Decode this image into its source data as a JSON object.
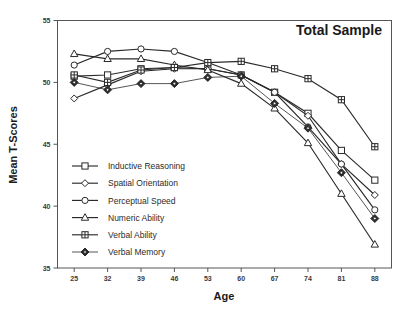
{
  "chart_data": {
    "type": "line",
    "title": "Total Sample",
    "xlabel": "Age",
    "ylabel": "Mean T-Scores",
    "x": [
      25,
      32,
      39,
      46,
      53,
      60,
      67,
      74,
      81,
      88
    ],
    "xtick_labels": [
      "25",
      "32",
      "39",
      "46",
      "53",
      "60",
      "67",
      "74",
      "81",
      "88"
    ],
    "ytick_labels": [
      "35",
      "40",
      "45",
      "50",
      "55"
    ],
    "yticks": [
      35,
      40,
      45,
      50,
      55
    ],
    "xlim": [
      21.5,
      91.5
    ],
    "ylim": [
      35,
      55
    ],
    "grid": false,
    "legend_position": "lower-left-inside",
    "series": [
      {
        "name": "Inductive Reasoning",
        "marker": "square-open",
        "values": [
          50.5,
          50.6,
          51.1,
          51.2,
          51.1,
          50.6,
          49.2,
          47.5,
          44.5,
          42.1
        ]
      },
      {
        "name": "Spatial Orientation",
        "marker": "diamond-open",
        "values": [
          48.7,
          49.8,
          50.9,
          51.1,
          51.1,
          50.6,
          49.2,
          47.3,
          43.4,
          40.9
        ]
      },
      {
        "name": "Perceptual Speed",
        "marker": "circle-open",
        "values": [
          51.4,
          52.5,
          52.7,
          52.5,
          51.6,
          50.6,
          49.2,
          46.4,
          43.4,
          39.7
        ]
      },
      {
        "name": "Numeric Ability",
        "marker": "triangle-open",
        "values": [
          52.3,
          51.9,
          51.9,
          51.4,
          51.0,
          49.9,
          47.9,
          45.1,
          41.0,
          36.9
        ]
      },
      {
        "name": "Verbal Ability",
        "marker": "square-crossed",
        "values": [
          50.6,
          50.0,
          51.0,
          51.2,
          51.6,
          51.7,
          51.1,
          50.3,
          48.6,
          44.8
        ]
      },
      {
        "name": "Verbal Memory",
        "marker": "diamond-filled",
        "values": [
          50.0,
          49.4,
          49.9,
          49.9,
          50.4,
          50.5,
          48.3,
          46.3,
          42.7,
          39.0
        ]
      }
    ]
  },
  "legend": {
    "items": [
      {
        "label": "Inductive Reasoning"
      },
      {
        "label": "Spatial Orientation"
      },
      {
        "label": "Perceptual Speed"
      },
      {
        "label": "Numeric Ability"
      },
      {
        "label": "Verbal Ability"
      },
      {
        "label": "Verbal Memory"
      }
    ]
  }
}
